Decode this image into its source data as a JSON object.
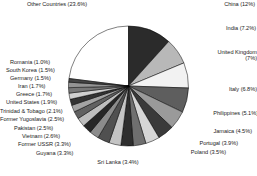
{
  "chart_data": {
    "type": "pie",
    "title": "",
    "xlabel": "",
    "ylabel": "",
    "legend_position": "none",
    "grid": false,
    "labels_show_percent": true,
    "categories": [
      "Other Countries",
      "China",
      "India",
      "United Kingdom",
      "Italy",
      "Philippines",
      "Jamaica",
      "Portugal",
      "Poland",
      "Sri Lanka",
      "Guyana",
      "Former USSR",
      "Vietnam",
      "Pakistan",
      "Former Yugoslavia",
      "Trinidad & Tobago",
      "United States",
      "Greece",
      "Iran",
      "Germany",
      "South Korea",
      "Romania"
    ],
    "values": [
      23.6,
      12.0,
      7.2,
      7.0,
      6.8,
      5.1,
      4.5,
      3.9,
      3.5,
      3.4,
      3.3,
      3.3,
      2.6,
      2.5,
      2.5,
      2.1,
      1.9,
      1.7,
      1.7,
      1.5,
      1.5,
      1.0
    ],
    "colors": [
      "#ffffff",
      "#2b2b2b",
      "#b8b8b8",
      "#f2f2f2",
      "#5e5e5e",
      "#9a9a9a",
      "#3a3a3a",
      "#d6d6d6",
      "#6f6f6f",
      "#2e2e2e",
      "#c4c4c4",
      "#505050",
      "#8c8c8c",
      "#262626",
      "#bdbdbd",
      "#616161",
      "#a3a3a3",
      "#333333",
      "#cfcfcf",
      "#787878",
      "#949494",
      "#454545"
    ],
    "slice_labels": [
      "Other Countries (23.6%)",
      "China (12%)",
      "India (7.2%)",
      "United Kingdom (7%)",
      "Italy (6.8%)",
      "Philippines (5.1%)",
      "Jamaica (4.5%)",
      "Portugal (3.9%)",
      "Poland (3.5%)",
      "Sri Lanka (3.4%)",
      "Guyana (3.3%)",
      "Former USSR (3.3%)",
      "Vietnam (2.6%)",
      "Pakistan (2.5%)",
      "Former Yugoslavia (2.5%)",
      "Trinidad & Tobago (2.1%)",
      "United States (1.9%)",
      "Greece (1.7%)",
      "Iran (1.7%)",
      "Germany (1.5%)",
      "South Korea (1.5%)",
      "Romania (1.0%)"
    ],
    "united_kingdom_label_line1": "United Kingdom",
    "united_kingdom_label_line2": "(7%)"
  }
}
